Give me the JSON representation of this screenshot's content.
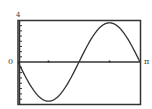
{
  "chart_data": {
    "type": "line",
    "title": "",
    "xlabel": "",
    "ylabel": "",
    "function": "y = -4 sin(2x)",
    "xlim": [
      0,
      3.14159
    ],
    "ylim": [
      -4,
      4
    ],
    "x_tick_labels": {
      "left": "0",
      "right": "π"
    },
    "y_tick_labels": {
      "top": "4"
    },
    "x_minor_ticks": [
      0.7854,
      2.3562
    ],
    "y_minor_tick_count_per_half": 8,
    "grid": false,
    "series": [
      {
        "name": "curve",
        "x": [
          0,
          0.3927,
          0.7854,
          1.1781,
          1.5708,
          1.9635,
          2.3562,
          2.7489,
          3.1416
        ],
        "values": [
          0,
          -2.83,
          -4,
          -2.83,
          0,
          2.83,
          4,
          2.83,
          0
        ]
      }
    ]
  },
  "labels": {
    "y_top": "4",
    "origin": "0",
    "x_right": "π"
  },
  "colors": {
    "line": "#333333",
    "frame": "#333333"
  }
}
